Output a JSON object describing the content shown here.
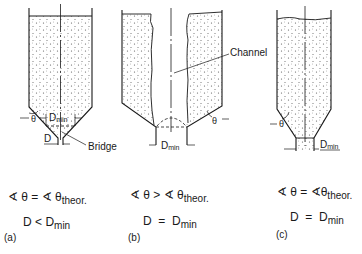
{
  "diagrams": [
    {
      "id": "a",
      "caption": "(a)",
      "labels": {
        "theta": "θ",
        "dmin": "D",
        "dmin_sub": "min",
        "d": "D",
        "bridge": "Bridge"
      },
      "condition1": {
        "lhs": "∢ θ = ∢ θ",
        "sub": "theor."
      },
      "condition2": {
        "lhs": "D",
        "op": "<",
        "rhs": "D",
        "sub": "min"
      }
    },
    {
      "id": "b",
      "caption": "(b)",
      "labels": {
        "theta": "θ",
        "dmin": "D",
        "dmin_sub": "min",
        "channel": "Channel"
      },
      "condition1": {
        "lhs": "∢ θ > ∢ θ",
        "sub": "theor."
      },
      "condition2": {
        "lhs": "D",
        "op": "=",
        "rhs": "D",
        "sub": "min"
      }
    },
    {
      "id": "c",
      "caption": "(c)",
      "labels": {
        "theta": "θ",
        "dmin": "D",
        "dmin_sub": "min"
      },
      "condition1": {
        "lhs": "∢ θ = ∢θ",
        "sub": "theor."
      },
      "condition2": {
        "lhs": "D",
        "op": "=",
        "rhs": "D",
        "sub": "min"
      }
    }
  ],
  "colors": {
    "line": "#1a1a1a",
    "fill": "#f4f4f4",
    "dots": "#555555"
  }
}
